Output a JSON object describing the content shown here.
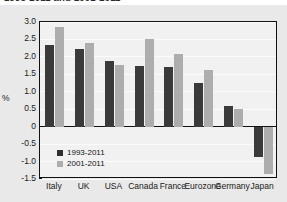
{
  "figure": {
    "title_clipped": "1993-2011 and 2001-2011",
    "background_color": "#e9e9e9",
    "plot_background_color": "#f1f1f1",
    "frame_color": "#111111"
  },
  "legend": {
    "position": "inside-bottom-left",
    "entries": [
      {
        "label": "1993-2011",
        "color": "#2f2f2f",
        "swatch": "square-swatch-dark"
      },
      {
        "label": "2001-2011",
        "color": "#adadad",
        "swatch": "square-swatch-light"
      }
    ]
  },
  "axis": {
    "ylabel": "%",
    "yticks": [
      "3.0",
      "2.5",
      "2.0",
      "1.5",
      "1.0",
      "0.5",
      "0",
      "-0.5",
      "-1.0",
      "-1.5"
    ],
    "ytick_values": [
      3.0,
      2.5,
      2.0,
      1.5,
      1.0,
      0.5,
      0,
      -0.5,
      -1.0,
      -1.5
    ]
  },
  "chart_data": {
    "type": "bar",
    "title": "1993-2011 and 2001-2011",
    "xlabel": "",
    "ylabel": "%",
    "ylim": [
      -1.5,
      3.0
    ],
    "grid": true,
    "legend_position": "inside-bottom-left",
    "categories": [
      "Italy",
      "UK",
      "USA",
      "Canada",
      "France",
      "Eurozone",
      "Germany",
      "Japan"
    ],
    "series": [
      {
        "name": "1993-2011",
        "color": "#3a3a3a",
        "values": [
          2.33,
          2.23,
          1.87,
          1.73,
          1.71,
          1.26,
          0.58,
          -0.88
        ]
      },
      {
        "name": "2001-2011",
        "color": "#adadad",
        "values": [
          2.87,
          2.4,
          1.77,
          2.52,
          2.08,
          1.62,
          0.5,
          -1.37
        ]
      }
    ]
  }
}
